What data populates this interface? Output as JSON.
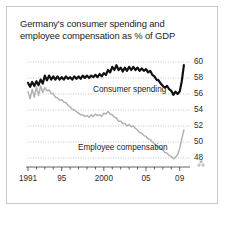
{
  "card": {
    "title": "Germany's consumer spending and employee compensation as % of GDP",
    "title_line1": "Germany's consumer spending and",
    "title_line2": "employee compensation as % of GDP",
    "border_color": "#c9c9c9",
    "background": "#ffffff",
    "ornament": "⁂"
  },
  "chart_data": {
    "type": "line",
    "title": "Germany's consumer spending and employee compensation as % of GDP",
    "xlabel": "",
    "ylabel": "% of GDP",
    "ylim": [
      48,
      60
    ],
    "yticks": [
      48,
      50,
      52,
      54,
      56,
      58,
      60
    ],
    "ytick_labels": [
      "48",
      "50",
      "52",
      "54",
      "56",
      "58",
      "60"
    ],
    "xlim": [
      1991,
      2009.75
    ],
    "xticks": [
      1991,
      1995,
      2000,
      2005,
      2009
    ],
    "xtick_labels": [
      "1991",
      "95",
      "2000",
      "05",
      "09"
    ],
    "grid": "horizontal-dotted",
    "legend": "inline-annotation",
    "colors": {
      "consumer_spending": "#111111",
      "employee_compensation": "#b2b2b2"
    },
    "x": [
      1991.0,
      1991.25,
      1991.5,
      1991.75,
      1992.0,
      1992.25,
      1992.5,
      1992.75,
      1993.0,
      1993.25,
      1993.5,
      1993.75,
      1994.0,
      1994.25,
      1994.5,
      1994.75,
      1995.0,
      1995.25,
      1995.5,
      1995.75,
      1996.0,
      1996.25,
      1996.5,
      1996.75,
      1997.0,
      1997.25,
      1997.5,
      1997.75,
      1998.0,
      1998.25,
      1998.5,
      1998.75,
      1999.0,
      1999.25,
      1999.5,
      1999.75,
      2000.0,
      2000.25,
      2000.5,
      2000.75,
      2001.0,
      2001.25,
      2001.5,
      2001.75,
      2002.0,
      2002.25,
      2002.5,
      2002.75,
      2003.0,
      2003.25,
      2003.5,
      2003.75,
      2004.0,
      2004.25,
      2004.5,
      2004.75,
      2005.0,
      2005.25,
      2005.5,
      2005.75,
      2006.0,
      2006.25,
      2006.5,
      2006.75,
      2007.0,
      2007.25,
      2007.5,
      2007.75,
      2008.0,
      2008.25,
      2008.5,
      2008.75,
      2009.0,
      2009.25,
      2009.5
    ],
    "series": [
      {
        "name": "Consumer spending",
        "label": "Consumer spending",
        "color": "#111111",
        "values": [
          57.4,
          56.9,
          57.5,
          57.0,
          57.6,
          57.1,
          57.8,
          57.3,
          58.3,
          57.7,
          58.3,
          57.8,
          58.2,
          57.8,
          58.2,
          57.8,
          58.1,
          57.8,
          58.2,
          57.9,
          58.1,
          57.8,
          58.2,
          57.9,
          58.2,
          57.9,
          58.3,
          58.0,
          58.3,
          58.0,
          58.3,
          58.1,
          58.4,
          58.1,
          58.5,
          58.2,
          58.6,
          58.4,
          59.0,
          58.7,
          59.4,
          59.0,
          59.6,
          59.0,
          59.3,
          58.8,
          59.3,
          58.9,
          59.4,
          59.0,
          59.4,
          59.0,
          59.3,
          58.9,
          59.2,
          58.9,
          59.1,
          58.7,
          58.9,
          58.4,
          58.2,
          57.8,
          57.7,
          57.3,
          57.0,
          56.8,
          57.0,
          56.6,
          56.4,
          55.9,
          56.3,
          56.0,
          56.3,
          57.6,
          59.6
        ]
      },
      {
        "name": "Employee compensation",
        "label": "Employee compensation",
        "color": "#b2b2b2",
        "values": [
          56.3,
          55.4,
          56.6,
          55.6,
          56.9,
          55.8,
          57.0,
          56.2,
          56.8,
          56.4,
          56.5,
          56.1,
          56.0,
          55.6,
          55.5,
          55.2,
          55.3,
          55.0,
          54.9,
          54.6,
          54.4,
          54.1,
          54.0,
          53.8,
          53.6,
          53.4,
          53.4,
          53.2,
          53.3,
          53.1,
          53.4,
          53.2,
          53.5,
          53.3,
          53.4,
          53.2,
          53.6,
          53.5,
          53.8,
          53.5,
          53.4,
          53.1,
          53.0,
          52.6,
          52.6,
          52.3,
          52.3,
          52.0,
          52.2,
          51.9,
          52.0,
          51.7,
          51.5,
          51.2,
          51.1,
          50.8,
          50.7,
          50.4,
          50.3,
          50.0,
          49.8,
          49.5,
          49.4,
          49.2,
          49.0,
          48.7,
          48.6,
          48.3,
          48.2,
          47.9,
          48.1,
          48.4,
          49.2,
          50.4,
          51.5
        ]
      }
    ]
  }
}
